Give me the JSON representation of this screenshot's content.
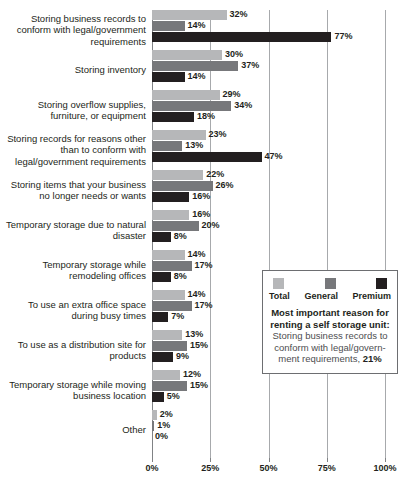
{
  "chart_data": {
    "type": "bar",
    "orientation": "horizontal",
    "title": "",
    "xlabel": "",
    "ylabel": "",
    "xlim": [
      0,
      100
    ],
    "xticks": [
      "0%",
      "25%",
      "50%",
      "75%",
      "100%"
    ],
    "xtick_values": [
      0,
      25,
      50,
      75,
      100
    ],
    "grid": true,
    "legend_position": "inside-right",
    "value_suffix": "%",
    "categories": [
      "Storing business records to conform with legal/government requirements",
      "Storing inventory",
      "Storing overflow supplies, furniture, or equipment",
      "Storing records for reasons other than to conform with legal/government requirements",
      "Storing items that your business no longer needs or wants",
      "Temporary storage due to natural disaster",
      "Temporary storage while remodeling offices",
      "To use an extra office space during busy times",
      "To use as a distribution site for products",
      "Temporary storage while moving business location",
      "Other"
    ],
    "series": [
      {
        "name": "Total",
        "color": "#b6b7b9",
        "values": [
          32,
          30,
          29,
          23,
          22,
          16,
          14,
          14,
          13,
          12,
          2
        ]
      },
      {
        "name": "General",
        "color": "#77787b",
        "values": [
          14,
          37,
          34,
          13,
          26,
          20,
          17,
          17,
          15,
          15,
          1
        ]
      },
      {
        "name": "Premium",
        "color": "#231f20",
        "values": [
          77,
          14,
          18,
          47,
          16,
          8,
          8,
          7,
          9,
          5,
          0
        ]
      }
    ],
    "labels": [
      [
        "32%",
        "14%",
        "77%"
      ],
      [
        "30%",
        "37%",
        "14%"
      ],
      [
        "29%",
        "34%",
        "18%"
      ],
      [
        "23%",
        "13%",
        "47%"
      ],
      [
        "22%",
        "26%",
        "16%"
      ],
      [
        "16%",
        "20%",
        "8%"
      ],
      [
        "14%",
        "17%",
        "8%"
      ],
      [
        "14%",
        "17%",
        "7%"
      ],
      [
        "13%",
        "15%",
        "9%"
      ],
      [
        "12%",
        "15%",
        "5%"
      ],
      [
        "2%",
        "1%",
        "0%"
      ]
    ],
    "annotation": {
      "title": "Most important reason for renting a self storage unit:",
      "body_prefix": "Storing business records to conform with legal/govern­ment requirements, ",
      "body_value": "21%"
    }
  }
}
